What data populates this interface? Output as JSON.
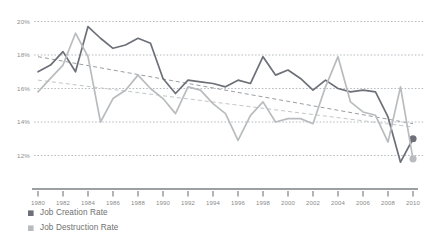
{
  "chart_data": {
    "type": "line",
    "title": "",
    "subtitle": "",
    "xlabel": "",
    "ylabel": "",
    "xlim": [
      1980,
      2010
    ],
    "ylim": [
      11.2,
      20.4
    ],
    "grid": true,
    "legend_position": "bottom-left",
    "y_ticks": [
      "20%",
      "18%",
      "16%",
      "14%",
      "12%"
    ],
    "y_tick_values": [
      20,
      18,
      16,
      14,
      12
    ],
    "x_ticks": [
      "1980",
      "1982",
      "1984",
      "1986",
      "1988",
      "1990",
      "1992",
      "1994",
      "1996",
      "1998",
      "2000",
      "2002",
      "2004",
      "2006",
      "2008",
      "2010"
    ],
    "x_tick_values": [
      1980,
      1982,
      1984,
      1986,
      1988,
      1990,
      1992,
      1994,
      1996,
      1998,
      2000,
      2002,
      2004,
      2006,
      2008,
      2010
    ],
    "x": [
      1980,
      1981,
      1982,
      1983,
      1984,
      1985,
      1986,
      1987,
      1988,
      1989,
      1990,
      1991,
      1992,
      1993,
      1994,
      1995,
      1996,
      1997,
      1998,
      1999,
      2000,
      2001,
      2002,
      2003,
      2004,
      2005,
      2006,
      2007,
      2008,
      2009,
      2010
    ],
    "series": [
      {
        "name": "Job Creation Rate",
        "color": "#6d7078",
        "values": [
          17.0,
          17.4,
          18.2,
          17.0,
          19.7,
          19.0,
          18.4,
          18.6,
          19.0,
          18.7,
          16.6,
          15.7,
          16.5,
          16.4,
          16.3,
          16.1,
          16.5,
          16.3,
          17.9,
          16.8,
          17.1,
          16.6,
          15.9,
          16.5,
          16.0,
          15.8,
          15.9,
          15.8,
          14.3,
          11.6,
          13.0
        ],
        "end_marker": {
          "x": 2010,
          "y": 13.0,
          "color": "#6d7078"
        }
      },
      {
        "name": "Job Destruction Rate",
        "color": "#b9bcbe",
        "values": [
          15.8,
          16.6,
          17.4,
          19.3,
          17.9,
          14.0,
          15.4,
          15.9,
          16.8,
          16.0,
          15.4,
          14.5,
          16.1,
          15.9,
          15.1,
          14.5,
          12.9,
          14.4,
          15.2,
          14.0,
          14.2,
          14.2,
          13.9,
          16.1,
          17.9,
          15.2,
          14.6,
          14.4,
          12.8,
          16.1,
          11.8
        ],
        "end_marker": {
          "x": 2010,
          "y": 11.8,
          "color": "#b9bcbe"
        }
      }
    ],
    "trendlines": [
      {
        "name": "Job Creation Rate trend",
        "color": "#9a9da2",
        "style": "dashed",
        "x0": 1980,
        "y0": 17.9,
        "x1": 2010,
        "y1": 13.9
      },
      {
        "name": "Job Destruction Rate trend",
        "color": "#c3c6c8",
        "style": "dashed",
        "x0": 1980,
        "y0": 16.5,
        "x1": 2010,
        "y1": 13.7
      }
    ]
  },
  "legend": {
    "items": [
      {
        "label": "Job Creation Rate",
        "color": "#6d7078"
      },
      {
        "label": "Job Destruction Rate",
        "color": "#b9bcbe"
      }
    ]
  },
  "axis": {
    "x_axis_color": "#7d8085",
    "gridline_color": "#9aa0a6"
  }
}
